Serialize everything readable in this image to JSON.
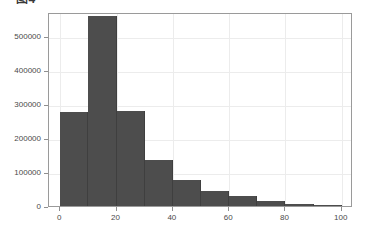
{
  "caption": {
    "text": "图4"
  },
  "chart_data": {
    "type": "bar",
    "title": "",
    "subtitle": "",
    "xlabel": "",
    "ylabel": "",
    "grid": true,
    "legend_position": "none",
    "bar_color": "#4d4d4d",
    "frame_color": "#9a9a9a",
    "gridline_color": "#ececec",
    "background_color": "#ffffff",
    "xlim": [
      -4,
      104
    ],
    "ylim": [
      0,
      570000
    ],
    "xticks": [
      0,
      20,
      40,
      60,
      80,
      100
    ],
    "xtick_labels": [
      "0",
      "20",
      "40",
      "60",
      "80",
      "100"
    ],
    "yticks": [
      0,
      100000,
      200000,
      300000,
      400000,
      500000
    ],
    "ytick_labels": [
      "0",
      "100000",
      "200000",
      "300000",
      "400000",
      "500000"
    ],
    "bin_width": 10,
    "bin_edges": [
      0,
      10,
      20,
      30,
      40,
      50,
      60,
      70,
      80,
      90,
      100
    ],
    "categories": [
      "0-10",
      "10-20",
      "20-30",
      "30-40",
      "40-50",
      "50-60",
      "60-70",
      "70-80",
      "80-90",
      "90-100"
    ],
    "values": [
      275000,
      557000,
      279000,
      135000,
      76000,
      43000,
      28000,
      14000,
      6000,
      3000
    ]
  }
}
